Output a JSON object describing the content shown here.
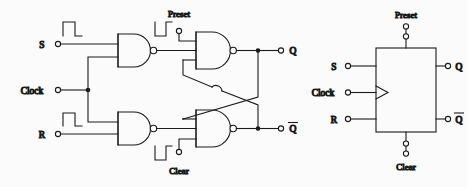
{
  "figure": {
    "type": "logic-circuit-diagram",
    "background_color": "#fbfbfb",
    "line_color": "#1a1a1a"
  },
  "gate_circuit": {
    "title": "NAND gate implementation",
    "inputs": [
      {
        "id": "s",
        "label": "S",
        "x": 56,
        "y": 44,
        "pulse": "positive"
      },
      {
        "id": "clock",
        "label": "Clock",
        "x": 56,
        "y": 90,
        "pulse": "none"
      },
      {
        "id": "r",
        "label": "R",
        "x": 56,
        "y": 134,
        "pulse": "positive"
      },
      {
        "id": "preset",
        "label": "Preset",
        "x": 179,
        "y": 31,
        "pulse": "negative"
      },
      {
        "id": "clear",
        "label": "Clear",
        "x": 179,
        "y": 152,
        "pulse": "negative"
      }
    ],
    "outputs": [
      {
        "id": "q",
        "label": "Q",
        "overline": false,
        "x": 281,
        "y": 44
      },
      {
        "id": "qbar",
        "label": "Q",
        "overline": true,
        "x": 281,
        "y": 134
      }
    ],
    "gates": [
      {
        "id": "nand-s",
        "type": "NAND",
        "inputs": 2,
        "role": "set-input-gate"
      },
      {
        "id": "nand-r",
        "type": "NAND",
        "inputs": 2,
        "role": "reset-input-gate"
      },
      {
        "id": "nand-q",
        "type": "NAND",
        "inputs": 3,
        "role": "q-latch-gate"
      },
      {
        "id": "nand-qbar",
        "type": "NAND",
        "inputs": 3,
        "role": "qbar-latch-gate"
      }
    ],
    "crossover": {
      "style": "hop",
      "note": "wires cross without connecting"
    }
  },
  "block_symbol": {
    "title": "Block symbol",
    "clock_edge_marker": "triangle",
    "inputs": [
      {
        "id": "s",
        "label": "S",
        "side": "left"
      },
      {
        "id": "clock",
        "label": "Clock",
        "side": "left"
      },
      {
        "id": "r",
        "label": "R",
        "side": "left"
      },
      {
        "id": "preset",
        "label": "Preset",
        "side": "top"
      },
      {
        "id": "clear",
        "label": "Clear",
        "side": "bottom"
      }
    ],
    "outputs": [
      {
        "id": "q",
        "label": "Q",
        "overline": false,
        "side": "right"
      },
      {
        "id": "qbar",
        "label": "Q",
        "overline": true,
        "side": "right"
      }
    ]
  }
}
